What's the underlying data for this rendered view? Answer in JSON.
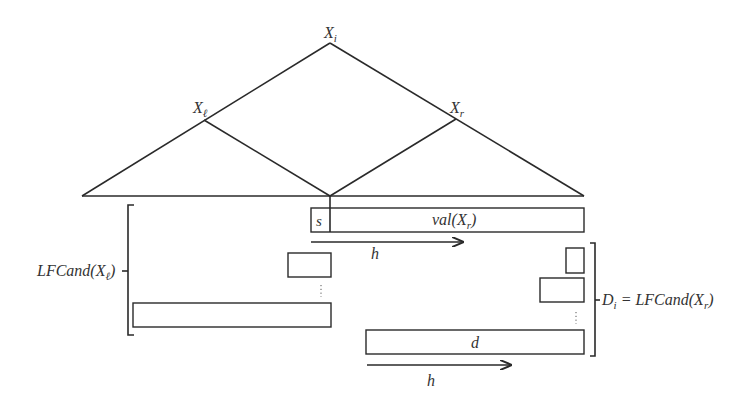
{
  "diagram": {
    "type": "tree-decomposition-illustration",
    "nodes": {
      "root": {
        "label": "X",
        "subscript": "i"
      },
      "left": {
        "label": "X",
        "subscript": "ℓ"
      },
      "right": {
        "label": "X",
        "subscript": "r"
      }
    },
    "top_bar": {
      "prefix_label": "s",
      "main_label": "val(X",
      "main_subscript": "r",
      "main_suffix": ")"
    },
    "arrows": [
      {
        "label": "h"
      },
      {
        "label": "h"
      }
    ],
    "left_group": {
      "label": "LFCand(X",
      "label_subscript": "ℓ",
      "label_suffix": ")"
    },
    "right_group": {
      "label_prefix": "D",
      "label_prefix_subscript": "i",
      "label_eq": " = LFCand(X",
      "label_subscript": "r",
      "label_suffix": ")"
    },
    "bottom_bar": {
      "label": "d"
    },
    "ellipsis": "⋮",
    "colors": {
      "stroke": "#2a2a2a",
      "text": "#333333",
      "background": "#ffffff"
    }
  }
}
